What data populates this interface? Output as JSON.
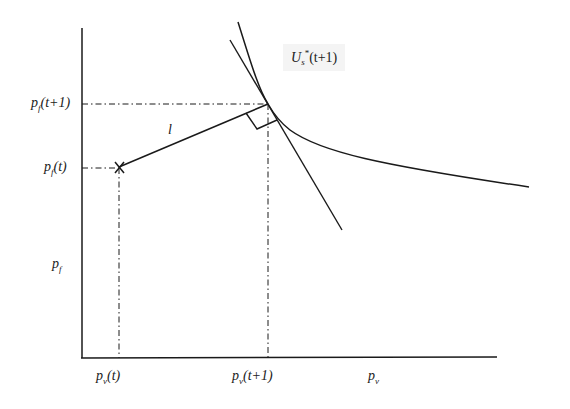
{
  "diagram": {
    "type": "economics-indifference-curve",
    "curve_label": {
      "main": "U",
      "sub": "s",
      "sup": "*",
      "arg": "(t+1)"
    },
    "segment_label": "l",
    "y_axis": {
      "label": "p_f",
      "label_main": "p",
      "label_sub": "f",
      "ticks": [
        {
          "main": "p",
          "sub": "f",
          "arg": "(t+1)"
        },
        {
          "main": "p",
          "sub": "f",
          "arg": "(t)"
        }
      ]
    },
    "x_axis": {
      "label_main": "p",
      "label_sub": "v",
      "ticks": [
        {
          "main": "p",
          "sub": "v",
          "arg": "(t)"
        },
        {
          "main": "p",
          "sub": "v",
          "arg": "(t+1)"
        }
      ]
    },
    "colors": {
      "line": "#1a1a1a",
      "background": "#ffffff",
      "label_bg": "#f4f4f4"
    }
  }
}
